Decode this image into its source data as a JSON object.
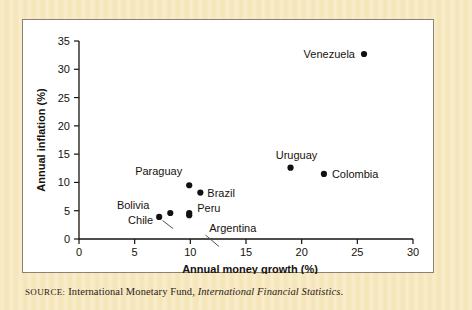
{
  "colors": {
    "page_background": "#f6e7bc",
    "plot_background": "#ffffff",
    "frame_border": "#8a8275",
    "ink": "#17120c",
    "marker": "#111111",
    "leader_line": "#55504a"
  },
  "source": {
    "label": "Source:",
    "label_display": "SOURCE:",
    "organization": "International Monetary Fund,",
    "publication": "International Financial Statistics",
    "terminator": "."
  },
  "chart_data": {
    "type": "scatter",
    "title": "",
    "xlabel": "Annual money growth (%)",
    "ylabel": "Annual inflation (%)",
    "xlim": [
      0,
      30
    ],
    "ylim": [
      0,
      35
    ],
    "xticks": [
      0,
      5,
      10,
      15,
      20,
      25,
      30
    ],
    "yticks": [
      0,
      5,
      10,
      15,
      20,
      25,
      30,
      35
    ],
    "xtick_labels": [
      "0",
      "5",
      "10",
      "15",
      "20",
      "25",
      "30"
    ],
    "ytick_labels": [
      "0",
      "5",
      "10",
      "15",
      "20",
      "25",
      "30",
      "35"
    ],
    "grid": false,
    "legend": "none",
    "points": [
      {
        "name": "Venezuela",
        "x": 25.6,
        "y": 32.7,
        "label_pos": "left",
        "leader": false
      },
      {
        "name": "Uruguay",
        "x": 19.0,
        "y": 12.6,
        "label_pos": "above",
        "leader": false
      },
      {
        "name": "Colombia",
        "x": 22.0,
        "y": 11.5,
        "label_pos": "right",
        "leader": false
      },
      {
        "name": "Paraguay",
        "x": 9.9,
        "y": 9.5,
        "label_pos": "above-left",
        "leader": false
      },
      {
        "name": "Brazil",
        "x": 10.9,
        "y": 8.2,
        "label_pos": "right",
        "leader": false
      },
      {
        "name": "Bolivia",
        "x": 8.2,
        "y": 4.6,
        "label_pos": "left",
        "leader": true
      },
      {
        "name": "Chile",
        "x": 7.2,
        "y": 3.9,
        "label_pos": "left",
        "leader": false
      },
      {
        "name": "Peru",
        "x": 9.9,
        "y": 4.6,
        "label_pos": "right",
        "leader": false
      },
      {
        "name": "Argentina",
        "x": 9.9,
        "y": 4.2,
        "label_pos": "below-right",
        "leader": true
      }
    ]
  }
}
